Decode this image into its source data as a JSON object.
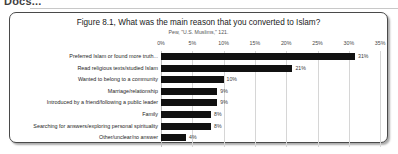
{
  "page": {
    "header_fragment": "Docs..."
  },
  "chart_data": {
    "type": "bar",
    "orientation": "horizontal",
    "title": "Figure 8.1, What was the main reason that you converted to Islam?",
    "subtitle": "Pew, \"U.S. Muslims,\" 121.",
    "xlabel": "",
    "ylabel": "",
    "xlim": [
      0,
      35
    ],
    "grid": true,
    "legend": false,
    "bar_color": "#111111",
    "tick_labels": [
      "0%",
      "5%",
      "10%",
      "15%",
      "20%",
      "25%",
      "30%",
      "35%"
    ],
    "ticks": [
      0,
      5,
      10,
      15,
      20,
      25,
      30,
      35
    ],
    "categories": [
      "Preferred Islam or found more truth...",
      "Read religious texts/studied Islam",
      "Wanted to belong to a community",
      "Marriage/relationship",
      "Introduced by a friend/following a public leader",
      "Family",
      "Searching for answers/exploring personal spirituality",
      "Other/unclear/no answer"
    ],
    "values": [
      31,
      21,
      10,
      9,
      9,
      8,
      8,
      4
    ],
    "value_labels": [
      "31%",
      "21%",
      "10%",
      "9%",
      "9%",
      "8%",
      "8%",
      "4%"
    ]
  }
}
